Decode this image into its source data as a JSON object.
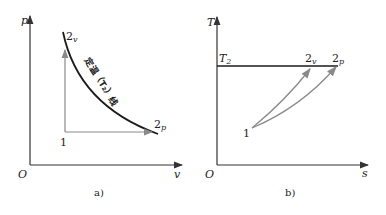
{
  "figure": {
    "panel_a": {
      "caption": "a)",
      "y_axis_label": "p",
      "x_axis_label": "v",
      "origin_label": "O",
      "curve_label": "定温（T₂）线",
      "points": {
        "start": "1",
        "end_v": "2",
        "end_v_sub": "v",
        "end_p": "2",
        "end_p_sub": "p"
      }
    },
    "panel_b": {
      "caption": "b)",
      "y_axis_label": "T",
      "x_axis_label": "s",
      "origin_label": "O",
      "isotherm_label": "T",
      "isotherm_sub": "2",
      "points": {
        "start": "1",
        "end_v": "2",
        "end_v_sub": "v",
        "end_p": "2",
        "end_p_sub": "p"
      }
    },
    "colors": {
      "axis": "#333333",
      "curve": "#1a1a1a",
      "process_arrow": "#8a8a8a"
    }
  }
}
